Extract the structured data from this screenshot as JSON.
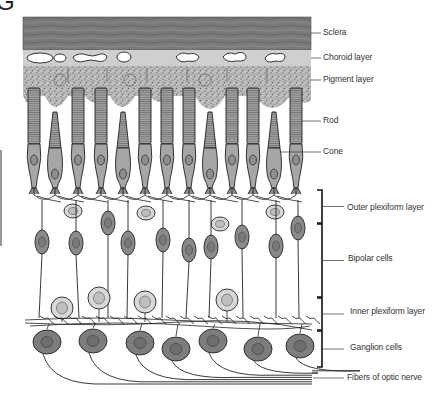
{
  "figure": {
    "title_fragment": "G"
  },
  "colors": {
    "sclera": "#7a7a7a",
    "choroid": "#cfcfcf",
    "pigment": "#a9a9a9",
    "photoreceptor": "#a6a6a6",
    "bipolar": "#8a8a8a",
    "amacrine_light": "#d8d8d8",
    "ganglion": "#7d7d7d",
    "line": "#222222"
  },
  "labels": [
    {
      "id": "sclera",
      "text": "Sclera",
      "y": 33
    },
    {
      "id": "choroid",
      "text": "Choroid layer",
      "y": 58
    },
    {
      "id": "pigment",
      "text": "Pigment layer",
      "y": 80
    },
    {
      "id": "rod",
      "text": "Rod",
      "y": 121
    },
    {
      "id": "cone",
      "text": "Cone",
      "y": 152
    },
    {
      "id": "outer-plexiform",
      "text": "Outer plexiform layer",
      "y": 208
    },
    {
      "id": "bipolar",
      "text": "Bipolar cells",
      "y": 259
    },
    {
      "id": "inner-plexiform",
      "text": "Inner plexiform layer",
      "y": 312
    },
    {
      "id": "ganglion",
      "text": "Ganglion cells",
      "y": 348
    },
    {
      "id": "optic-nerve",
      "text": "Fibers of optic nerve",
      "y": 378
    }
  ],
  "brackets": [
    {
      "id": "outer-plexiform",
      "top": 190,
      "bottom": 223
    },
    {
      "id": "bipolar",
      "top": 224,
      "bottom": 297
    },
    {
      "id": "inner-plexiform",
      "top": 298,
      "bottom": 330
    },
    {
      "id": "ganglion",
      "top": 331,
      "bottom": 367
    }
  ],
  "photoreceptors": [
    {
      "type": "rod",
      "x": 34
    },
    {
      "type": "cone",
      "x": 55
    },
    {
      "type": "rod",
      "x": 78
    },
    {
      "type": "rod",
      "x": 101
    },
    {
      "type": "cone",
      "x": 123
    },
    {
      "type": "rod",
      "x": 145
    },
    {
      "type": "rod",
      "x": 167
    },
    {
      "type": "rod",
      "x": 189
    },
    {
      "type": "cone",
      "x": 210
    },
    {
      "type": "rod",
      "x": 232
    },
    {
      "type": "rod",
      "x": 253
    },
    {
      "type": "cone",
      "x": 274
    },
    {
      "type": "rod",
      "x": 296
    }
  ],
  "horizontal_cells": [
    {
      "x": 73,
      "y": 211
    },
    {
      "x": 146,
      "y": 213
    },
    {
      "x": 220,
      "y": 224
    },
    {
      "x": 275,
      "y": 212
    }
  ],
  "bipolar_cells": [
    {
      "x": 42,
      "y": 242
    },
    {
      "x": 76,
      "y": 243
    },
    {
      "x": 108,
      "y": 223
    },
    {
      "x": 128,
      "y": 243
    },
    {
      "x": 163,
      "y": 240
    },
    {
      "x": 189,
      "y": 250
    },
    {
      "x": 211,
      "y": 247
    },
    {
      "x": 242,
      "y": 237
    },
    {
      "x": 276,
      "y": 246
    },
    {
      "x": 298,
      "y": 228
    }
  ],
  "amacrine_cells": [
    {
      "x": 62,
      "y": 308
    },
    {
      "x": 99,
      "y": 298
    },
    {
      "x": 145,
      "y": 302
    },
    {
      "x": 227,
      "y": 300
    }
  ],
  "ganglion_cells": [
    {
      "x": 47,
      "y": 342
    },
    {
      "x": 93,
      "y": 341
    },
    {
      "x": 140,
      "y": 343
    },
    {
      "x": 176,
      "y": 349
    },
    {
      "x": 213,
      "y": 341
    },
    {
      "x": 258,
      "y": 349
    },
    {
      "x": 300,
      "y": 346
    }
  ]
}
